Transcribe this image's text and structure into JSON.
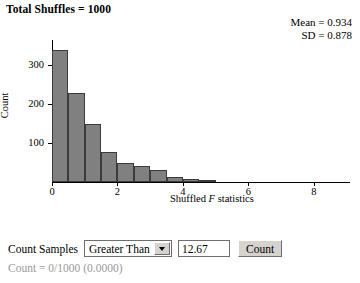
{
  "header": {
    "total_shuffles_label": "Total Shuffles = 1000"
  },
  "stats": {
    "mean": "Mean = 0.934",
    "sd": "SD = 0.878"
  },
  "controls": {
    "count_samples_label": "Count Samples",
    "direction_selected": "Greater Than",
    "direction_options": [
      "Greater Than",
      "Less Than",
      "Between",
      "Beyond"
    ],
    "threshold_value": "12.67",
    "threshold_placeholder": "",
    "count_button_label": "Count",
    "result_text": "Count = 0/1000 (0.0000)",
    "dropdown_icon": "chevron-down-icon"
  },
  "colors": {
    "bar_fill": "#808080",
    "bar_stroke": "#3b3b3b",
    "axis": "#000000",
    "result_text": "#9a9a9a",
    "control_face": "#d6d3ce"
  },
  "chart_data": {
    "type": "bar",
    "title": "",
    "xlabel": "Shuffled F statistics",
    "ylabel": "Count",
    "bin_width": 0.5,
    "xlim": [
      0,
      9.1
    ],
    "ylim": [
      0,
      364
    ],
    "grid": false,
    "legend": null,
    "xticks": [
      0,
      2,
      4,
      6,
      8
    ],
    "yticks": [
      100,
      200,
      300
    ],
    "bin_starts": [
      0,
      0.5,
      1.0,
      1.5,
      2.0,
      2.5,
      3.0,
      3.5,
      4.0,
      4.5
    ],
    "categories": [
      "0-0.5",
      "0.5-1.0",
      "1.0-1.5",
      "1.5-2.0",
      "2.0-2.5",
      "2.5-3.0",
      "3.0-3.5",
      "3.5-4.0",
      "4.0-4.5",
      "4.5-5.0"
    ],
    "values": [
      338,
      228,
      149,
      77,
      48,
      40,
      30,
      12,
      8,
      2
    ]
  }
}
